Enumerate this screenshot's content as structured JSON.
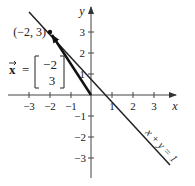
{
  "figure": {
    "type": "vector-diagram",
    "axes": {
      "x_label": "x",
      "y_label": "y",
      "x_ticks": [
        "−3",
        "−2",
        "−1",
        "1",
        "2",
        "3"
      ],
      "y_ticks_pos": [
        "1",
        "2",
        "3"
      ],
      "y_ticks_neg": [
        "−1",
        "−2",
        "−3"
      ]
    },
    "point": {
      "label": "(−2, 3)",
      "x": -2,
      "y": 3
    },
    "vector": {
      "name": "x⃗",
      "symbol": "x",
      "equals": "=",
      "components": [
        "−2",
        "3"
      ]
    },
    "line": {
      "equation": "x + y = 1"
    },
    "colors": {
      "ink": "#222222",
      "axis": "#444444"
    }
  }
}
